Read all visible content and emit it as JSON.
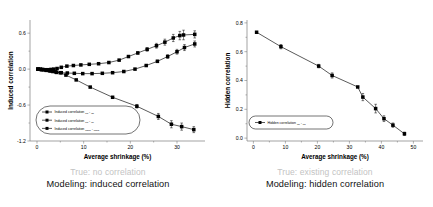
{
  "figure": {
    "panels": [
      {
        "id": "left",
        "caption_true": "True: no correlation",
        "caption_model": "Modeling: induced correlation",
        "chart_ref": 0
      },
      {
        "id": "right",
        "caption_true": "True: existing correlation",
        "caption_model": "Modeling: hidden correlation",
        "chart_ref": 1
      }
    ]
  },
  "chart_data": [
    {
      "type": "line",
      "title": "",
      "xlabel": "Average shrinkage (%)",
      "ylabel": "Induced correlation",
      "xlim": [
        -1.5,
        36
      ],
      "ylim": [
        -1.2,
        0.82
      ],
      "xticks": [
        0,
        10,
        20,
        30
      ],
      "yticks": [
        0.6,
        0.0,
        -0.6,
        -1.2
      ],
      "xticklabels": [
        "0",
        "10",
        "20",
        "30"
      ],
      "yticklabels": [
        "0.6",
        "0.0",
        "-0.6",
        "-1.2"
      ],
      "grid": false,
      "legend_position": "lower-left",
      "marker": "filled-square",
      "series": [
        {
          "name": "Induced correlation ηa - ηb",
          "legend_label": "Induced correlation",
          "legend_sub1": "ηa",
          "legend_sep": "-",
          "legend_sub2": "ηb",
          "x": [
            0.2,
            0.7,
            1.2,
            1.8,
            2.4,
            3.0,
            3.6,
            4.3,
            5.2,
            6.4,
            7.8,
            9.4,
            11.2,
            13.2,
            15.4,
            17.6,
            19.6,
            21.6,
            23.6,
            25.6,
            27.4,
            29.2,
            30.6,
            31.4,
            33.8
          ],
          "y": [
            0.0,
            0.0,
            -0.005,
            -0.01,
            -0.01,
            -0.005,
            0.0,
            0.01,
            0.03,
            0.05,
            0.06,
            0.07,
            0.08,
            0.09,
            0.11,
            0.15,
            0.21,
            0.27,
            0.33,
            0.39,
            0.45,
            0.52,
            0.56,
            0.57,
            0.58
          ],
          "yerr": [
            0,
            0,
            0,
            0,
            0,
            0,
            0,
            0,
            0,
            0,
            0,
            0,
            0,
            0,
            0,
            0,
            0,
            0.02,
            0.03,
            0.04,
            0.05,
            0.06,
            0.07,
            0.08,
            0.06
          ]
        },
        {
          "name": "Induced correlation ηa - ηc",
          "legend_label": "Induced correlation",
          "legend_sub1": "ηa",
          "legend_sep": "-",
          "legend_sub2": "ηc",
          "x": [
            0.2,
            0.8,
            1.4,
            2.0,
            2.7,
            3.4,
            4.2,
            5.2,
            6.5,
            8.0,
            9.8,
            11.8,
            14.0,
            16.2,
            18.6,
            21.0,
            23.4,
            25.8,
            28.0,
            30.0,
            31.6,
            33.8
          ],
          "y": [
            0.0,
            -0.005,
            -0.01,
            -0.02,
            -0.03,
            -0.04,
            -0.055,
            -0.06,
            -0.065,
            -0.07,
            -0.075,
            -0.075,
            -0.07,
            -0.06,
            -0.04,
            0.0,
            0.06,
            0.13,
            0.21,
            0.29,
            0.36,
            0.42
          ],
          "yerr": [
            0,
            0,
            0,
            0,
            0,
            0,
            0,
            0,
            0,
            0,
            0,
            0,
            0,
            0,
            0,
            0,
            0,
            0.02,
            0.03,
            0.04,
            0.05,
            0.05
          ]
        },
        {
          "name": "Induced correlation ηbcd - ηbcd",
          "legend_label": "Induced correlation",
          "legend_sub1": "ηbcd",
          "legend_sep": "-",
          "legend_sub2": "ηbcd",
          "x": [
            0.2,
            1.0,
            2.0,
            3.0,
            4.0,
            5.0,
            6.2,
            8.4,
            11.4,
            16.2,
            21.4,
            26.0,
            28.8,
            31.0,
            33.6
          ],
          "y": [
            0.0,
            -0.01,
            -0.02,
            -0.03,
            -0.045,
            -0.06,
            -0.1,
            -0.18,
            -0.3,
            -0.47,
            -0.62,
            -0.79,
            -0.92,
            -0.96,
            -1.01
          ],
          "yerr": [
            0,
            0,
            0,
            0,
            0,
            0,
            0,
            0,
            0,
            0,
            0.03,
            0.05,
            0.06,
            0.06,
            0.05
          ]
        }
      ]
    },
    {
      "type": "line",
      "title": "",
      "xlabel": "Average shrinkage (%)",
      "ylabel": "Hidden correlation",
      "xlim": [
        -2,
        53
      ],
      "ylim": [
        -0.02,
        0.82
      ],
      "xticks": [
        0,
        10,
        20,
        30,
        40,
        50
      ],
      "yticks": [
        0.0,
        0.2,
        0.4,
        0.6,
        0.8
      ],
      "xticklabels": [
        "0",
        "10",
        "20",
        "30",
        "40",
        "50"
      ],
      "yticklabels": [
        "0.0",
        "0.2",
        "0.4",
        "0.6",
        "0.8"
      ],
      "grid": false,
      "legend_position": "lower-left",
      "marker": "filled-square",
      "series": [
        {
          "name": "Hidden correlation ηa - ηb",
          "legend_label": "Hidden correlation",
          "legend_sub1": "ηa",
          "legend_sep": "-",
          "legend_sub2": "ηb",
          "x": [
            1.0,
            8.6,
            20.4,
            24.6,
            32.6,
            34.2,
            38.2,
            40.8,
            43.6,
            47.2
          ],
          "y": [
            0.735,
            0.635,
            0.5,
            0.435,
            0.355,
            0.285,
            0.205,
            0.135,
            0.09,
            0.03
          ],
          "yerr": [
            0,
            0.015,
            0.012,
            0.018,
            0,
            0.025,
            0.03,
            0.02,
            0.015,
            0.012
          ]
        }
      ]
    }
  ]
}
